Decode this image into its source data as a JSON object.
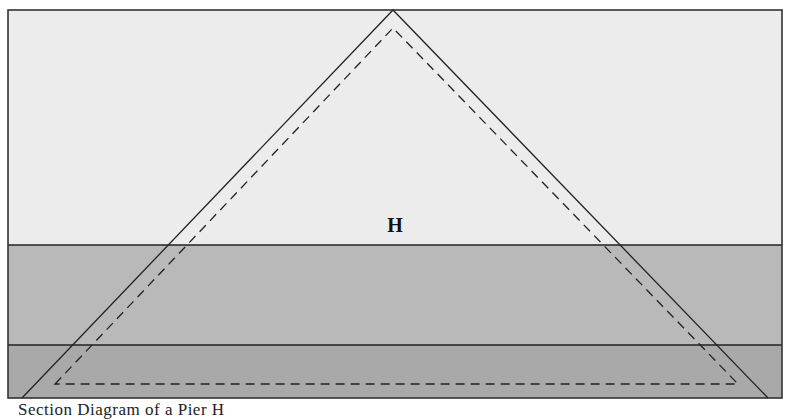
{
  "diagram": {
    "label": "H",
    "caption": "Section Diagram of a Pier H",
    "colors": {
      "upper_zone": "#ececec",
      "middle_band": "#b9b9b9",
      "lower_band": "#a9a9a9",
      "lines": "#222222",
      "page": "#ffffff"
    },
    "frame": {
      "x": 8,
      "y": 10,
      "width": 774,
      "height": 388
    },
    "bands": [
      {
        "name": "upper-zone",
        "y_top": 10,
        "y_bottom": 245
      },
      {
        "name": "middle-band",
        "y_top": 245,
        "y_bottom": 345
      },
      {
        "name": "lower-band",
        "y_top": 345,
        "y_bottom": 398
      }
    ],
    "outer_triangle": {
      "apex": [
        393,
        10
      ],
      "base_left": [
        22,
        398
      ],
      "base_right": [
        768,
        398
      ],
      "style": "solid"
    },
    "inner_triangle": {
      "apex": [
        393,
        28
      ],
      "base_left": [
        55,
        384
      ],
      "base_right": [
        738,
        384
      ],
      "style": "dashed"
    }
  }
}
